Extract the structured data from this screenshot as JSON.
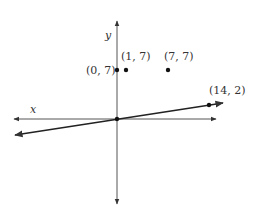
{
  "diagram": {
    "type": "coordinate-plane",
    "axes": {
      "x_label": "x",
      "y_label": "y"
    },
    "points": [
      {
        "label": "(0, 7)",
        "x": 0,
        "y": 7
      },
      {
        "label": "(1, 7)",
        "x": 1,
        "y": 7
      },
      {
        "label": "(7, 7)",
        "x": 7,
        "y": 7
      },
      {
        "label": "(14, 2)",
        "x": 14,
        "y": 2
      }
    ],
    "line": {
      "through": [
        "(0, 0)",
        "(14, 2)"
      ]
    },
    "colors": {
      "axis": "#555555",
      "line": "#222222",
      "point": "#111111",
      "text": "#333333"
    }
  }
}
